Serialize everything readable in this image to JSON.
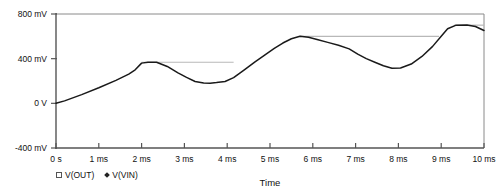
{
  "chart_data": {
    "type": "line",
    "title": "",
    "xlabel": "Time",
    "ylabel": "",
    "grid": false,
    "legend_position": "bottom-left",
    "xlim": [
      0,
      10
    ],
    "ylim": [
      -400,
      800
    ],
    "xunit": "ms",
    "yunit": "mV",
    "xtick_labels": [
      "0 s",
      "1 ms",
      "2 ms",
      "3 ms",
      "4 ms",
      "5 ms",
      "6 ms",
      "7 ms",
      "8 ms",
      "9 ms",
      "10 ms"
    ],
    "xtick_values": [
      0,
      1,
      2,
      3,
      4,
      5,
      6,
      7,
      8,
      9,
      10
    ],
    "ytick_labels": [
      "800 mV",
      "400 mV",
      "0 V",
      "-400 mV"
    ],
    "ytick_values": [
      800,
      400,
      0,
      -400
    ],
    "series": [
      {
        "name": "V(OUT)",
        "marker": "square",
        "color": "#1a1a1a",
        "x": [
          0.0,
          0.2,
          0.6,
          1.0,
          1.4,
          1.7,
          1.85,
          2.0,
          2.15,
          2.35,
          2.6,
          2.85,
          3.05,
          3.25,
          3.45,
          3.6,
          3.75,
          3.95,
          4.15,
          4.4,
          4.65,
          4.9,
          5.1,
          5.3,
          5.5,
          5.7,
          5.9,
          6.1,
          6.35,
          6.6,
          6.85,
          7.05,
          7.25,
          7.45,
          7.65,
          7.85,
          8.05,
          8.3,
          8.55,
          8.8,
          9.0,
          9.15,
          9.35,
          9.6,
          9.8,
          10.0
        ],
        "y": [
          0,
          22,
          78,
          140,
          206,
          262,
          300,
          360,
          368,
          368,
          330,
          272,
          232,
          196,
          182,
          180,
          186,
          196,
          230,
          300,
          372,
          438,
          492,
          540,
          578,
          600,
          592,
          572,
          546,
          520,
          488,
          440,
          400,
          368,
          336,
          314,
          316,
          352,
          420,
          510,
          600,
          668,
          700,
          702,
          688,
          652
        ]
      },
      {
        "name": "V(VIN)",
        "marker": "diamond",
        "color": "#b8b8b8",
        "hold_segments": [
          {
            "x_start": 2.0,
            "x_end": 4.15,
            "y": 368
          },
          {
            "x_start": 5.7,
            "x_end": 8.95,
            "y": 600
          },
          {
            "x_start": 9.3,
            "x_end": 10.0,
            "y": 700
          }
        ]
      }
    ],
    "legend": [
      {
        "label": "V(OUT)",
        "marker": "square",
        "color": "#555555"
      },
      {
        "label": "V(VIN)",
        "marker": "diamond",
        "color": "#222222"
      }
    ]
  },
  "colors": {
    "axis": "#555555",
    "frame": "#7a7a7a",
    "trace_out": "#1a1a1a",
    "trace_vin": "#bdbdbd",
    "text": "#111111",
    "background": "#ffffff"
  }
}
